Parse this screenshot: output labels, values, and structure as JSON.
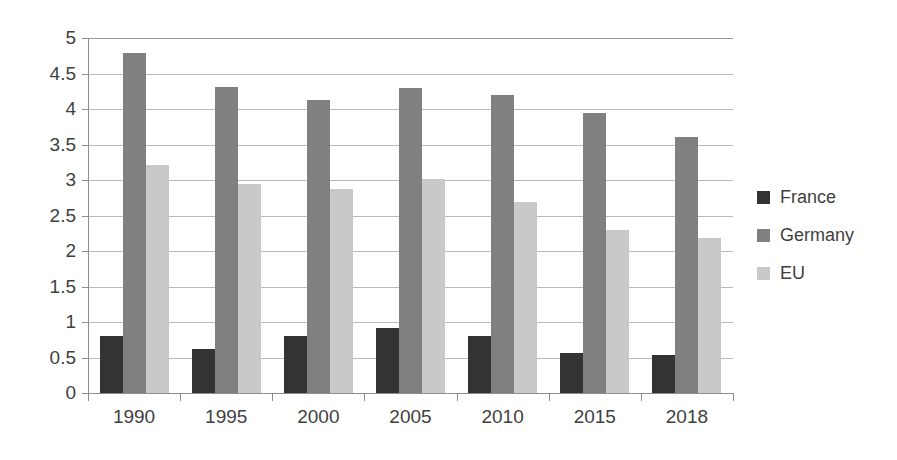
{
  "chart_data": {
    "type": "bar",
    "title": "",
    "subtitle": "",
    "xlabel": "",
    "ylabel": "",
    "categories": [
      "1990",
      "1995",
      "2000",
      "2005",
      "2010",
      "2015",
      "2018"
    ],
    "series": [
      {
        "name": "France",
        "color": "#333333",
        "values": [
          0.8,
          0.62,
          0.8,
          0.92,
          0.8,
          0.56,
          0.53
        ]
      },
      {
        "name": "Germany",
        "color": "#808080",
        "values": [
          4.79,
          4.31,
          4.12,
          4.3,
          4.2,
          3.94,
          3.6
        ]
      },
      {
        "name": "EU",
        "color": "#c9c9c9",
        "values": [
          3.21,
          2.94,
          2.87,
          3.01,
          2.69,
          2.3,
          2.18
        ]
      }
    ],
    "ylim": [
      0,
      5
    ],
    "ytick_step": 0.5,
    "ytick_labels": [
      "0",
      "0.5",
      "1",
      "1.5",
      "2",
      "2.5",
      "3",
      "3.5",
      "4",
      "4.5",
      "5"
    ],
    "grid": true,
    "grid_axis": "y",
    "legend_position": "right",
    "background": "#ffffff",
    "grid_color": "#b9b9b9",
    "axis_color": "#8d8d8d",
    "text_color": "#3f3f3f"
  },
  "legend": {
    "items": [
      {
        "label": "France"
      },
      {
        "label": "Germany"
      },
      {
        "label": "EU"
      }
    ]
  }
}
